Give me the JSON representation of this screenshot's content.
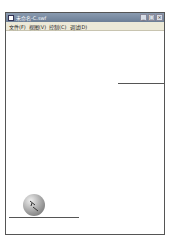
{
  "window": {
    "title": "未命名-C.swf",
    "controls": {
      "minimize": "_",
      "maximize": "□",
      "close": "×"
    }
  },
  "menubar": {
    "items": [
      {
        "label": "文件(F)"
      },
      {
        "label": "视图(V)"
      },
      {
        "label": "控制(C)"
      },
      {
        "label": "调试(D)"
      }
    ]
  }
}
